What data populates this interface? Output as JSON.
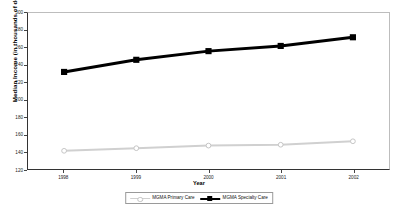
{
  "chart_data": {
    "type": "line",
    "title": "",
    "xlabel": "Year",
    "ylabel": "Median Income (in thousands of dollars)",
    "categories": [
      "1998",
      "1999",
      "2000",
      "2001",
      "2002"
    ],
    "x": [
      1998,
      1999,
      2000,
      2001,
      2002
    ],
    "ylim": [
      120,
      300
    ],
    "yticks": [
      120,
      140,
      160,
      180,
      200,
      220,
      240,
      260,
      280,
      300
    ],
    "ytick_labels": [
      "120",
      "140",
      "160",
      "180",
      "200",
      "220",
      "240",
      "260",
      "280",
      "300"
    ],
    "grid": false,
    "legend_position": "bottom",
    "series": [
      {
        "name": "MGMA Primary Care",
        "values": [
          141,
          144,
          147,
          148,
          152
        ],
        "color": "#d0d0d0",
        "marker": "circle",
        "line_width": 2
      },
      {
        "name": "MGMA Specialty Care",
        "values": [
          232,
          246,
          256,
          262,
          272
        ],
        "color": "#000000",
        "marker": "square",
        "line_width": 3
      }
    ]
  },
  "axes": {
    "y_title": "Median Income (in thousands of dollars)",
    "x_title": "Year"
  },
  "legend": {
    "entries": [
      {
        "label": "MGMA Primary Care"
      },
      {
        "label": "MGMA Specialty Care"
      }
    ]
  },
  "colors": {
    "primary_care": "#d0d0d0",
    "specialty_care": "#000000",
    "axis": "#333333",
    "frame_light": "#bdbdbd",
    "background": "#ffffff"
  }
}
